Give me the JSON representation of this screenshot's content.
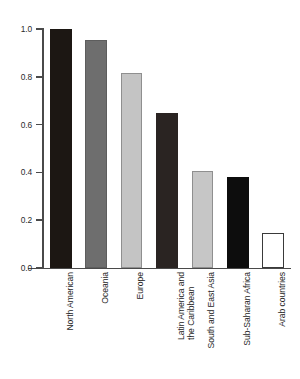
{
  "chart_data": {
    "type": "bar",
    "title": "",
    "subtitle": "",
    "xlabel": "",
    "ylabel": "",
    "categories": [
      "North American",
      "Oceania",
      "Europe",
      "Latin America and the Caribbean",
      "South and East Asia",
      "Sub-Saharan Africa",
      "Arab countries"
    ],
    "category_lines": [
      [
        "North American"
      ],
      [
        "Oceania"
      ],
      [
        "Europe"
      ],
      [
        "Latin America and",
        "the Caribbean"
      ],
      [
        "South and East Asia"
      ],
      [
        "Sub-Saharan Africa"
      ],
      [
        "Arab countries"
      ]
    ],
    "values": [
      1.0,
      0.955,
      0.815,
      0.65,
      0.405,
      0.38,
      0.145
    ],
    "bar_colors": [
      "#1c1713",
      "#6e6e6e",
      "#c4c4c4",
      "#2a2422",
      "#c6c6c6",
      "#0d0d0d",
      "#ffffff"
    ],
    "bar_edge_colors": [
      "#1c1713",
      "#5d5d5d",
      "#8f8f8f",
      "#2a2422",
      "#8f8f8f",
      "#0d0d0d",
      "#3a3a3a"
    ],
    "ylim": [
      0.0,
      1.0
    ],
    "yticks": [
      0.0,
      0.2,
      0.4,
      0.6,
      0.8,
      1.0
    ],
    "ytick_labels": [
      "0.0",
      "0.2",
      "0.4",
      "0.6",
      "0.8",
      "1.0"
    ],
    "grid": false,
    "legend": null,
    "legend_position": "none",
    "axis_color": "#4a4a4a",
    "background_color": "#ffffff"
  }
}
